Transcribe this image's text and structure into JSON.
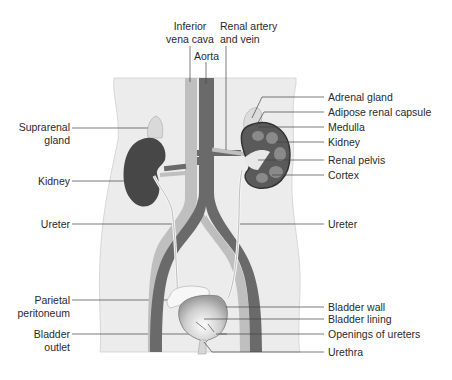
{
  "diagram": {
    "colors": {
      "body": "#ececec",
      "body_outline": "#c8c8c8",
      "vein": "#bdbdbd",
      "artery": "#6e6e6e",
      "kidney_dark": "#4a4a4a",
      "ureter": "#f2f2f2",
      "leader_line": "#333333"
    },
    "top_labels": {
      "inferior_vena_cava_l1": "Inferior",
      "inferior_vena_cava_l2": "vena cava",
      "aorta": "Aorta",
      "renal_artery_l1": "Renal artery",
      "renal_artery_l2": "and vein"
    },
    "left_labels": {
      "suprarenal_l1": "Suprarenal",
      "suprarenal_l2": "gland",
      "kidney": "Kidney",
      "ureter": "Ureter",
      "parietal_l1": "Parietal",
      "parietal_l2": "peritoneum",
      "bladder_outlet_l1": "Bladder",
      "bladder_outlet_l2": "outlet"
    },
    "right_labels": {
      "adrenal_gland": "Adrenal gland",
      "adipose_capsule": "Adipose renal capsule",
      "medulla": "Medulla",
      "kidney": "Kidney",
      "renal_pelvis": "Renal pelvis",
      "cortex": "Cortex",
      "ureter": "Ureter",
      "bladder_wall": "Bladder wall",
      "bladder_lining": "Bladder lining",
      "openings_of_ureters": "Openings of ureters",
      "urethra": "Urethra"
    }
  }
}
